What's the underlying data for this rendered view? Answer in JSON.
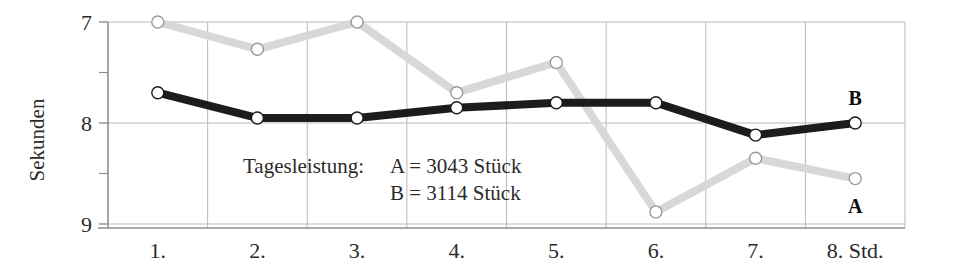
{
  "chart_data": {
    "type": "line",
    "title": "",
    "xlabel": "",
    "ylabel": "Sekunden",
    "x_unit_suffix": "Std.",
    "categories": [
      "1.",
      "2.",
      "3.",
      "4.",
      "5.",
      "6.",
      "7.",
      "8. Std."
    ],
    "x_tick_labels": [
      "1.",
      "2.",
      "3.",
      "4.",
      "5.",
      "6.",
      "7.",
      "8. Std."
    ],
    "y_tick_labels": [
      "7",
      "8",
      "9"
    ],
    "y_major_ticks": [
      7,
      8,
      9
    ],
    "y_minor_ticks": [
      7.5,
      8.5
    ],
    "ylim": [
      7,
      9
    ],
    "y_axis_inverted": true,
    "grid": true,
    "legend": "inline-endpoint-labels",
    "series": [
      {
        "name": "A",
        "color": "#d8d8d8",
        "marker": "open-circle",
        "endpoint_label": "A",
        "values": [
          7.0,
          7.27,
          7.0,
          7.7,
          7.4,
          8.88,
          8.35,
          8.55
        ]
      },
      {
        "name": "B",
        "color": "#1c1c1c",
        "marker": "open-circle",
        "endpoint_label": "B",
        "values": [
          7.7,
          7.95,
          7.95,
          7.85,
          7.8,
          7.8,
          8.12,
          8.0
        ]
      }
    ],
    "annotations": {
      "heading": "Tagesleistung:",
      "lines": [
        "A = 3043 Stück",
        "B = 3114 Stück"
      ]
    }
  },
  "colors": {
    "series_a": "#d8d8d8",
    "series_b": "#1c1c1c",
    "grid": "#b9b9b9",
    "axis": "#8f8f8f",
    "text": "#2b2b2b",
    "background": "#ffffff",
    "marker_fill": "#ffffff"
  }
}
